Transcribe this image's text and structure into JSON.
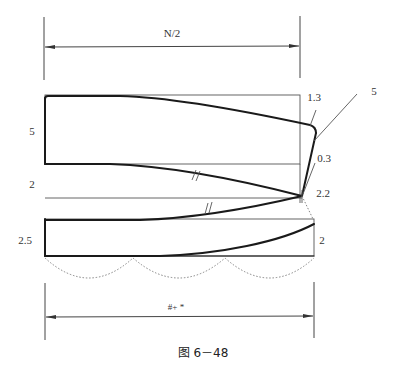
{
  "figure": {
    "caption": "图 6－48",
    "top_dimension": {
      "label": "N/2"
    },
    "bottom_dimension": {
      "label": "#+  *"
    },
    "left_labels": {
      "section_1": "5",
      "section_2": "2",
      "section_3": "2.5"
    },
    "right_labels": {
      "corner_offset": "1.3",
      "leader_value": "5",
      "side_offset": "0.3",
      "point_offset": "2.2",
      "lower_right": "2"
    },
    "marks": {
      "equal_length_mark": "//"
    }
  }
}
